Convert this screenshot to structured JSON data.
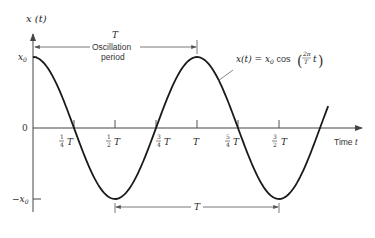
{
  "diagram": {
    "y_axis_label": "x (t)",
    "x_axis_label": "Time t",
    "amplitude_top_label": "x0",
    "amplitude_bottom_label": "−x0",
    "zero_label": "0",
    "equation": "x(t) = x0 cos (2π/T t)",
    "equation_parts": {
      "lhs": "x(t) =",
      "x0": "x",
      "x0_sub": "0",
      "cos": "cos",
      "num": "2π",
      "den": "T",
      "t": "t"
    },
    "top_span": {
      "symbol": "T",
      "label_line1": "Oscillation",
      "label_line2": "period"
    },
    "bottom_span": {
      "symbol": "T"
    },
    "ticks": [
      {
        "num": "1",
        "den": "4",
        "sym": "T"
      },
      {
        "num": "1",
        "den": "2",
        "sym": "T"
      },
      {
        "num": "3",
        "den": "4",
        "sym": "T"
      },
      {
        "num": "",
        "den": "",
        "sym": "T"
      },
      {
        "num": "5",
        "den": "4",
        "sym": "T"
      },
      {
        "num": "3",
        "den": "2",
        "sym": "T"
      }
    ],
    "curve": {
      "function": "x0*cos(2*pi*t/T)",
      "t_start": 0,
      "t_end_periods": 1.8,
      "color": "#1a1a1a"
    }
  }
}
